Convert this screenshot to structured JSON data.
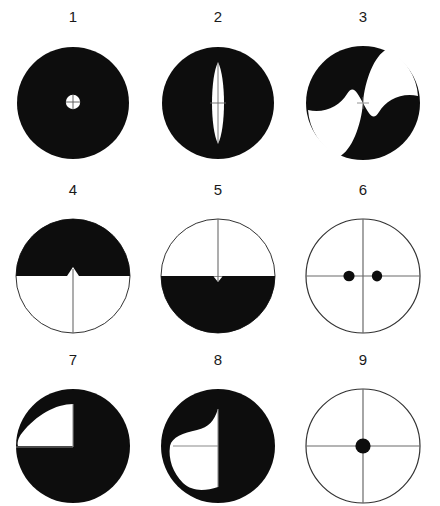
{
  "plate": {
    "width": 440,
    "height": 506,
    "background_color": "#ffffff",
    "ink_color": "#0d0d0d",
    "line_color": "#555555",
    "label_color": "#1a1a1a",
    "columns": 3,
    "rows": 3
  },
  "figures": [
    {
      "label": "1",
      "name": "figure-1-filled-disc-with-central-white-circle",
      "description": "Solid black disc with small white circle at center bearing a crosshair",
      "fill": "black-disc",
      "center": [
        72,
        95
      ],
      "radius": 56,
      "white_center_circle_diameter": 14
    },
    {
      "label": "2",
      "name": "figure-2-filled-disc-with-vertical-white-lens",
      "description": "Solid black disc with tall narrow white vertical lens through center, vertical midline and short horizontal tick",
      "fill": "black-disc",
      "center": [
        217,
        95
      ],
      "radius": 56,
      "lens_height": 82,
      "lens_width": 15
    },
    {
      "label": "3",
      "name": "figure-3-pinwheel-two-white-blades",
      "description": "Black disc with two white curved pinwheel blades, upper-right and lower-left",
      "fill": "black-disc",
      "center": [
        364,
        95
      ],
      "radius": 57,
      "blades": 2
    },
    {
      "label": "4",
      "name": "figure-4-top-half-black-with-upward-notch",
      "description": "Circle, upper half black, lower half white; vertical line from center to bottom; small upward triangular notch at center",
      "fill": "top-half-black",
      "center": [
        72,
        268
      ],
      "radius": 57,
      "notch": "triangle-up"
    },
    {
      "label": "5",
      "name": "figure-5-bottom-half-black-with-downward-notch",
      "description": "Circle, lower half black, upper half white; vertical line from top to center; small V notch dip at center",
      "fill": "bottom-half-black",
      "center": [
        217,
        268
      ],
      "radius": 57,
      "notch": "v-dip"
    },
    {
      "label": "6",
      "name": "figure-6-outline-circle-crosshair-two-dots",
      "description": "Outline circle with full crosshair and two small black dots flanking centre on the horizontal axis",
      "fill": "outline",
      "center": [
        364,
        268
      ],
      "radius": 57,
      "dots": [
        {
          "x": 350,
          "y": 268,
          "d": 11
        },
        {
          "x": 378,
          "y": 268,
          "d": 11
        }
      ]
    },
    {
      "label": "7",
      "name": "figure-7-filled-disc-white-upper-left-region",
      "description": "Black disc with curved white region filling the upper-left quadrant, bounded by centre lines",
      "fill": "black-disc",
      "center": [
        72,
        438
      ],
      "radius": 57,
      "white_region": "upper-left-curved"
    },
    {
      "label": "8",
      "name": "figure-8-filled-disc-white-left-crescent",
      "description": "Black disc with white crescent-leaf region on the left half bounded right by the vertical centre line",
      "fill": "black-disc",
      "center": [
        217,
        438
      ],
      "radius": 57,
      "white_region": "left-crescent"
    },
    {
      "label": "9",
      "name": "figure-9-outline-circle-crosshair-center-dot",
      "description": "Outline circle with full crosshair and a single black dot at the centre",
      "fill": "outline",
      "center": [
        364,
        438
      ],
      "radius": 57,
      "dots": [
        {
          "x": 364,
          "y": 438,
          "d": 15
        }
      ]
    }
  ]
}
